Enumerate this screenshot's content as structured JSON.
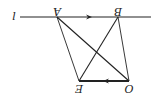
{
  "diagram": {
    "rotation_deg": 180,
    "labels": {
      "line": "l",
      "A": "A",
      "B": "B",
      "E": "E",
      "O": "O"
    },
    "points": {
      "A": [
        57,
        17
      ],
      "B": [
        118,
        17
      ],
      "E": [
        79,
        81
      ],
      "O": [
        129,
        81
      ]
    },
    "line_l": {
      "x_start": 20,
      "x_end": 151,
      "y": 17,
      "arrow_direction": "right"
    },
    "segment_OE": {
      "arrow_direction": "left",
      "emphasized": true
    },
    "stroke_color": "#222222"
  }
}
